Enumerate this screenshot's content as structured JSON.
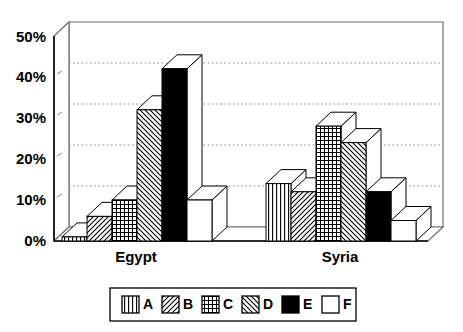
{
  "chart_data": {
    "type": "bar",
    "title": "",
    "subtitle": "",
    "xlabel": "",
    "ylabel": "",
    "categories": [
      "Egypt",
      "Syria"
    ],
    "series": [
      {
        "name": "A",
        "pattern": "vertical-lines",
        "values": [
          1,
          14
        ]
      },
      {
        "name": "B",
        "pattern": "diagonal-forward",
        "values": [
          6,
          12
        ]
      },
      {
        "name": "C",
        "pattern": "grid-crosshatch",
        "values": [
          10,
          28
        ]
      },
      {
        "name": "D",
        "pattern": "diagonal-backward",
        "values": [
          32,
          24
        ]
      },
      {
        "name": "E",
        "pattern": "solid-black",
        "values": [
          42,
          12
        ]
      },
      {
        "name": "F",
        "pattern": "white-empty",
        "values": [
          10,
          5
        ]
      }
    ],
    "ylim": [
      0,
      50
    ],
    "yticks": [
      0,
      10,
      20,
      30,
      40,
      50
    ],
    "ytick_labels": [
      "0%",
      "10%",
      "20%",
      "30%",
      "40%",
      "50%"
    ],
    "grid": true,
    "grid_style": "dotted-horizontal",
    "legend_position": "bottom",
    "style": "3d-bar",
    "colors": {
      "axis": "#000000",
      "grid": "#808080",
      "bar_fill": "#ffffff",
      "bar_outline": "#000000",
      "solid_series": "#000000",
      "background": "#ffffff"
    }
  },
  "axis": {
    "y_ticks": [
      {
        "label": "50%",
        "value": 50
      },
      {
        "label": "40%",
        "value": 40
      },
      {
        "label": "30%",
        "value": 30
      },
      {
        "label": "20%",
        "value": 20
      },
      {
        "label": "10%",
        "value": 10
      },
      {
        "label": "0%",
        "value": 0
      }
    ],
    "x_categories": [
      {
        "label": "Egypt"
      },
      {
        "label": "Syria"
      }
    ]
  },
  "legend": {
    "entries": [
      {
        "label": "A",
        "pattern": "vertical-lines"
      },
      {
        "label": "B",
        "pattern": "diagonal-forward"
      },
      {
        "label": "C",
        "pattern": "grid-crosshatch"
      },
      {
        "label": "D",
        "pattern": "diagonal-backward"
      },
      {
        "label": "E",
        "pattern": "solid-black"
      },
      {
        "label": "F",
        "pattern": "white-empty"
      }
    ]
  }
}
